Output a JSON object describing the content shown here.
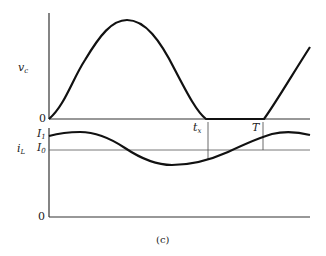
{
  "figure": {
    "caption": "(c)",
    "top_plot": {
      "ylabel": "v",
      "ylabel_sub": "c",
      "zero_label": "0",
      "description": "Capacitor voltage: sinusoidal hump from 0 to 0 at t_x, stays at 0, then rises again after T"
    },
    "bottom_plot": {
      "ylabel": "i",
      "ylabel_sub": "L",
      "zero_label": "0",
      "level_I1": "I",
      "level_I1_sub": "1",
      "level_I0": "I",
      "level_I0_sub": "0",
      "marker_tx": "t",
      "marker_tx_sub": "x",
      "marker_T": "T",
      "description": "Inductor current oscillating about I0, starting at I1"
    },
    "colors": {
      "curve": "#111111",
      "axis": "#333333",
      "reference": "#555555"
    }
  }
}
